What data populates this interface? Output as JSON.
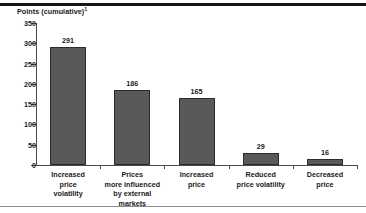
{
  "figure": {
    "top_rule_color": "#161616",
    "bottom_rule_color": "#8d8d8d",
    "background": "#ffffff"
  },
  "chart_data": {
    "type": "bar",
    "title": "",
    "ylabel": "Points (cumulative)",
    "ylabel_footnote": "1",
    "xlabel": "",
    "ylim": [
      0,
      350
    ],
    "ytick_step": 50,
    "yticks": [
      "0",
      "50",
      "100",
      "150",
      "200",
      "250",
      "300",
      "350"
    ],
    "ytick_values": [
      0,
      50,
      100,
      150,
      200,
      250,
      300,
      350
    ],
    "grid": false,
    "legend": "none",
    "bar_color": "#595959",
    "bar_edge_color": "#2b2b2b",
    "categories": [
      "Increased price volatility",
      "Prices more influenced by external markets",
      "Increased price",
      "Reduced price volatility",
      "Decreased price"
    ],
    "category_label_lines": [
      [
        "Increased",
        "price",
        "volatility"
      ],
      [
        "Prices",
        "more influenced",
        "by external",
        "markets"
      ],
      [
        "Increased",
        "price"
      ],
      [
        "Reduced",
        "price volatility"
      ],
      [
        "Decreased",
        "price"
      ]
    ],
    "values": [
      291,
      186,
      165,
      29,
      16
    ],
    "value_labels": [
      "291",
      "186",
      "165",
      "29",
      "16"
    ]
  }
}
